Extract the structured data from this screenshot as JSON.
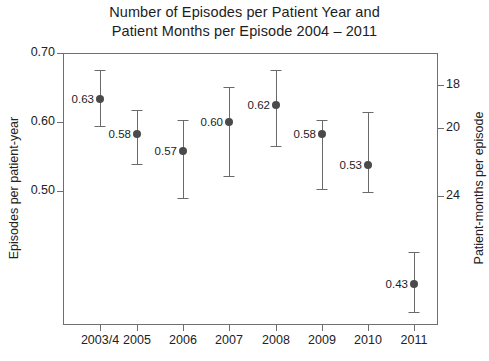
{
  "chart": {
    "title_line1": "Number of Episodes per Patient Year and",
    "title_line2": "Patient Months per Episode 2004 – 2011",
    "y_axis_left_title": "Episodes per patient-year",
    "y_axis_right_title": "Patient-months per episode"
  },
  "chart_data": {
    "type": "scatter",
    "title": "Number of Episodes per Patient Year and Patient Months per Episode 2004 – 2011",
    "xlabel": "",
    "ylabel": "Episodes per patient-year",
    "ylabel_right": "Patient-months per episode",
    "grid": false,
    "legend": null,
    "categories": [
      "2003/4",
      "2005",
      "2006",
      "2007",
      "2008",
      "2009",
      "2010",
      "2011"
    ],
    "values": [
      0.63,
      0.58,
      0.57,
      0.6,
      0.62,
      0.58,
      0.53,
      0.43
    ],
    "point_labels": [
      "0.63",
      "0.58",
      "0.57",
      "0.60",
      "0.62",
      "0.58",
      "0.53",
      "0.43"
    ],
    "error_upper": [
      0.675,
      0.635,
      0.625,
      0.665,
      0.675,
      0.625,
      0.59,
      0.478
    ],
    "error_lower": [
      0.585,
      0.557,
      0.513,
      0.535,
      0.565,
      0.525,
      0.475,
      0.39
    ],
    "ylim": [
      0.385,
      0.715
    ],
    "yticks": [
      0.7,
      0.6,
      0.5
    ],
    "ytick_labels": [
      "0.70",
      "0.60",
      "0.50"
    ],
    "y_right_ticks": [
      18,
      20,
      24
    ],
    "y_right_tick_labels": [
      "18",
      "20",
      "24"
    ],
    "marker_color": "#4a4a4a",
    "errorbar_color": "#6a6a6a",
    "axis_color": "#6f6f6f"
  },
  "layout": {
    "plot": {
      "left": 63,
      "top": 53,
      "width": 375,
      "height": 272
    },
    "y_left_tick_y": [
      53,
      122,
      191
    ],
    "y_right_tick_y": [
      85,
      128,
      196
    ],
    "x_tick_x": [
      100,
      137,
      183,
      229,
      276,
      322,
      368,
      414
    ],
    "points": [
      {
        "x": 100,
        "y": 99,
        "top": 70,
        "bottom": 126
      },
      {
        "x": 137,
        "y": 134,
        "top": 110,
        "bottom": 164
      },
      {
        "x": 183,
        "y": 151,
        "top": 120,
        "bottom": 198
      },
      {
        "x": 229,
        "y": 122,
        "top": 87,
        "bottom": 176
      },
      {
        "x": 276,
        "y": 105,
        "top": 70,
        "bottom": 146
      },
      {
        "x": 322,
        "y": 134,
        "top": 120,
        "bottom": 189
      },
      {
        "x": 368,
        "y": 165,
        "top": 112,
        "bottom": 192
      },
      {
        "x": 414,
        "y": 284,
        "top": 252,
        "bottom": 312
      }
    ]
  }
}
